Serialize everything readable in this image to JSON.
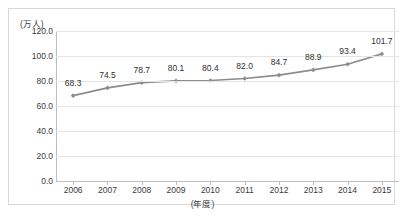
{
  "top_fragment": "",
  "chart_data": {
    "type": "line",
    "title": "",
    "xlabel": "(年度)",
    "ylabel": "(万人)",
    "categories": [
      "2006",
      "2007",
      "2008",
      "2009",
      "2010",
      "2011",
      "2012",
      "2013",
      "2014",
      "2015"
    ],
    "values": [
      68.3,
      74.5,
      78.7,
      80.1,
      80.4,
      82.0,
      84.7,
      88.9,
      93.4,
      101.7
    ],
    "point_labels": [
      "68.3",
      "74.5",
      "78.7",
      "80.1",
      "80.4",
      "82.0",
      "84.7",
      "88.9",
      "93.4",
      "101.7"
    ],
    "ylim": [
      0.0,
      120.0
    ],
    "ytick_labels": [
      "120.0",
      "100.0",
      "80.0",
      "60.0",
      "40.0",
      "20.0",
      "0.0"
    ],
    "ytick_values": [
      120.0,
      100.0,
      80.0,
      60.0,
      40.0,
      20.0,
      0.0
    ],
    "grid": true,
    "legend": false,
    "series_color": "#8c8c8c",
    "marker": "diamond",
    "grid_color": "#e4e4e4",
    "axis_color": "#bdbdbd"
  }
}
